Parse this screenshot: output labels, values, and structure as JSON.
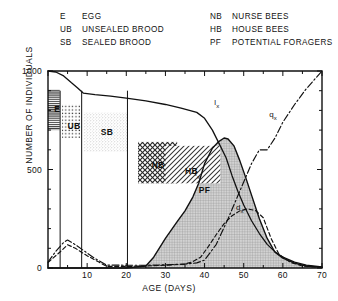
{
  "legend": {
    "left": [
      {
        "abbr": "E",
        "expn": "EGG"
      },
      {
        "abbr": "UB",
        "expn": "UNSEALED BROOD"
      },
      {
        "abbr": "SB",
        "expn": "SEALED  BROOD"
      }
    ],
    "right": [
      {
        "abbr": "NB",
        "expn": "NURSE  BEES"
      },
      {
        "abbr": "HB",
        "expn": "HOUSE  BEES"
      },
      {
        "abbr": "PF",
        "expn": "POTENTIAL  FORAGERS"
      }
    ]
  },
  "chart_data": {
    "type": "line",
    "title": "",
    "xlabel": "AGE  (DAYS)",
    "ylabel": "NUMBER  OF  INDIVIDUALS",
    "xlim": [
      0,
      70
    ],
    "ylim": [
      0,
      1000
    ],
    "xticks": [
      0,
      10,
      20,
      30,
      40,
      50,
      60,
      70
    ],
    "xticklabels": [
      "0",
      "10",
      "20",
      "30",
      "40",
      "50",
      "60",
      "70"
    ],
    "yticks": [
      0,
      500,
      1000
    ],
    "yticklabels": [
      "0",
      "500",
      "1000"
    ],
    "xminor_step": 5,
    "yminor_step": 100,
    "grid": false,
    "legend_position": "above-plot",
    "series": [
      {
        "name": "lx",
        "label": "l",
        "label_sub": "x",
        "style": "solid",
        "label_xy": [
          42.5,
          830
        ],
        "x": [
          0,
          2,
          4,
          6,
          7.5,
          9,
          12,
          16,
          20,
          25,
          30,
          34,
          38,
          40,
          42,
          44,
          45.5,
          47,
          48.5,
          50,
          52,
          54,
          56,
          58,
          60,
          63,
          66,
          70
        ],
        "y": [
          1000,
          995,
          975,
          940,
          915,
          888,
          880,
          872,
          862,
          848,
          830,
          812,
          790,
          760,
          700,
          620,
          560,
          470,
          390,
          320,
          240,
          175,
          120,
          82,
          55,
          30,
          15,
          5
        ]
      },
      {
        "name": "qx",
        "label": "q",
        "label_sub": "x",
        "style": "dashdot",
        "label_xy": [
          56.5,
          770
        ],
        "x": [
          0,
          2,
          4,
          5,
          7,
          9,
          12,
          15,
          20,
          25,
          30,
          35,
          38,
          40,
          43,
          46,
          49,
          52,
          54,
          56,
          58,
          60,
          63,
          66,
          70
        ],
        "y": [
          30,
          85,
          130,
          142,
          118,
          90,
          48,
          15,
          14,
          14,
          16,
          20,
          26,
          40,
          120,
          250,
          390,
          530,
          600,
          600,
          660,
          740,
          830,
          910,
          1000
        ]
      },
      {
        "name": "fx",
        "label": "f",
        "label_sub": "x",
        "style": "solid-filled",
        "label_xy": [
          37.5,
          472
        ],
        "x": [
          0,
          20,
          25,
          27,
          30,
          33,
          35,
          37,
          38.5,
          40,
          42,
          43.5,
          45,
          46,
          47.5,
          49,
          50.5,
          52,
          54,
          56,
          58,
          60,
          63,
          66,
          70
        ],
        "y": [
          0,
          0,
          10,
          55,
          150,
          235,
          290,
          360,
          430,
          530,
          608,
          640,
          660,
          655,
          620,
          545,
          460,
          370,
          250,
          150,
          80,
          50,
          25,
          10,
          3
        ]
      },
      {
        "name": "dx",
        "label": "d",
        "label_sub": "x",
        "style": "dashed",
        "label_xy": [
          48,
          300
        ],
        "x": [
          0,
          3,
          5,
          7,
          10,
          13,
          15,
          20,
          25,
          30,
          35,
          37,
          39,
          41,
          43,
          45,
          47,
          49,
          51,
          53,
          55,
          57,
          59,
          62,
          65,
          70
        ],
        "y": [
          28,
          80,
          118,
          100,
          62,
          30,
          8,
          8,
          10,
          14,
          20,
          32,
          55,
          110,
          170,
          225,
          265,
          290,
          300,
          292,
          255,
          150,
          70,
          28,
          10,
          3
        ]
      }
    ],
    "regions": [
      {
        "name": "E",
        "label": "E",
        "x0": 0,
        "x1": 3,
        "y0": 700,
        "y1": 905,
        "pattern": "horizontal-lines"
      },
      {
        "name": "UB",
        "label": "UB",
        "x0": 3.6,
        "x1": 8.2,
        "y0": 660,
        "y1": 830,
        "pattern": "dots"
      },
      {
        "name": "SB",
        "label": "SB",
        "x0": 9.2,
        "x1": 20.2,
        "y0": 590,
        "y1": 790,
        "pattern": "stipple"
      },
      {
        "name": "NB",
        "label": "NB",
        "x0": 23,
        "x1": 33,
        "y0": 430,
        "y1": 640,
        "pattern": "cross-hatch"
      },
      {
        "name": "HB",
        "label": "HB",
        "x0": 30,
        "x1": 44,
        "y0": 430,
        "y1": 620,
        "pattern": "diagonal-lines"
      },
      {
        "name": "PF",
        "label": "PF",
        "x0": 25,
        "x1": 70,
        "y0": 0,
        "y1": 660,
        "pattern": "fine-grid-fill"
      }
    ],
    "boundary_verticals": [
      3.1,
      8.6,
      20.3
    ]
  }
}
